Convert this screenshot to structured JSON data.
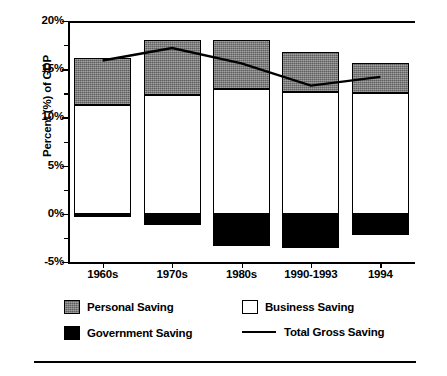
{
  "chart_data": {
    "type": "bar",
    "subtype": "stacked-bar-with-line-overlay",
    "title": "",
    "subtitle": "",
    "xlabel": "",
    "ylabel": "Percent (%) of GDP",
    "categories": [
      "1960s",
      "1970s",
      "1980s",
      "1990-1993",
      "1994"
    ],
    "ylim": [
      -5,
      20
    ],
    "yticks": [
      -5,
      0,
      5,
      10,
      15,
      20
    ],
    "ytick_labels": [
      "-5%",
      "0%",
      "5%",
      "10%",
      "15%",
      "20%"
    ],
    "yminor_ticks": [
      -2.5,
      2.5,
      7.5,
      12.5,
      17.5
    ],
    "grid": false,
    "legend_position": "bottom",
    "series": [
      {
        "name": "Personal Saving",
        "type": "bar-segment",
        "color": "#7e7e7e",
        "values": [
          4.9,
          5.7,
          5.1,
          4.2,
          3.1
        ],
        "segment_bottoms": [
          11.3,
          12.3,
          12.9,
          12.6,
          12.5
        ],
        "segment_tops": [
          16.2,
          18.0,
          18.0,
          16.8,
          15.6
        ]
      },
      {
        "name": "Business Saving",
        "type": "bar-segment",
        "color": "#ffffff",
        "values": [
          11.3,
          12.3,
          12.9,
          12.6,
          12.5
        ],
        "segment_bottoms": [
          0,
          0,
          0,
          0,
          0
        ],
        "segment_tops": [
          11.3,
          12.3,
          12.9,
          12.6,
          12.5
        ]
      },
      {
        "name": "Government Saving",
        "type": "bar-segment",
        "color": "#000000",
        "values": [
          -0.3,
          -1.2,
          -3.3,
          -3.5,
          -2.2
        ],
        "segment_bottoms": [
          -0.3,
          -1.2,
          -3.3,
          -3.5,
          -2.2
        ],
        "segment_tops": [
          0,
          0,
          0,
          0,
          0
        ]
      },
      {
        "name": "Total Gross Saving",
        "type": "line",
        "color": "#000000",
        "values": [
          15.9,
          17.2,
          15.6,
          13.3,
          14.2
        ]
      }
    ]
  },
  "axis": {
    "y_title": "Percent (%) of GDP"
  },
  "legend": {
    "items": [
      {
        "label": "Personal Saving",
        "marker": "swatch-gray"
      },
      {
        "label": "Business Saving",
        "marker": "swatch-white"
      },
      {
        "label": "Government Saving",
        "marker": "swatch-black"
      },
      {
        "label": "Total Gross Saving",
        "marker": "line-black"
      }
    ]
  }
}
